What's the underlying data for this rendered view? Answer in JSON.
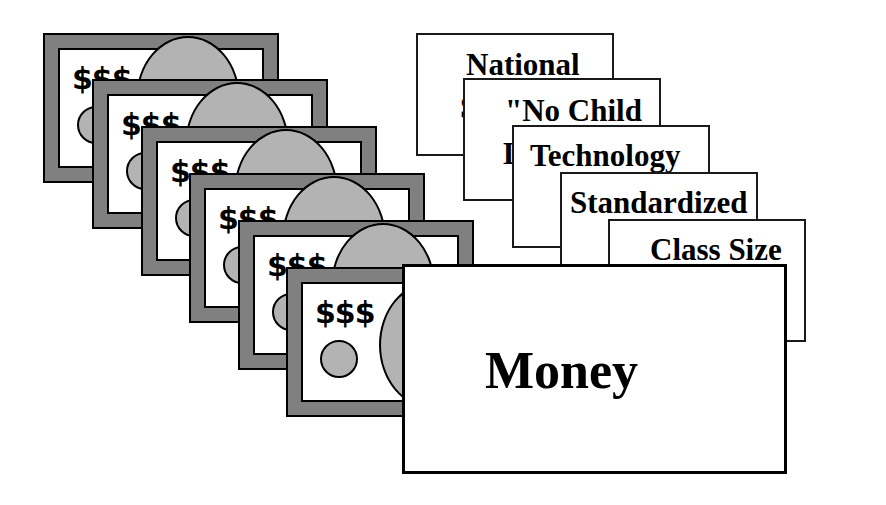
{
  "figure": {
    "type": "layered-stack-diagram",
    "background_color": "#ffffff",
    "line_color": "#000000"
  },
  "money_stack": {
    "name": "money-bills",
    "count": 6,
    "symbol": "$$$",
    "frame_color": "#808080",
    "inner_color": "#ffffff",
    "ellipse_color": "#b3b3b3",
    "border_color": "#000000",
    "bills": [
      {
        "label": "$$$",
        "x": 43,
        "y": 33,
        "w": 236,
        "h": 150
      },
      {
        "label": "$$$",
        "x": 92,
        "y": 79,
        "w": 236,
        "h": 150
      },
      {
        "label": "$$$",
        "x": 141,
        "y": 126,
        "w": 236,
        "h": 150
      },
      {
        "label": "$$$",
        "x": 189,
        "y": 173,
        "w": 236,
        "h": 150
      },
      {
        "label": "$$$",
        "x": 238,
        "y": 220,
        "w": 236,
        "h": 150
      },
      {
        "label": "$$$",
        "x": 286,
        "y": 267,
        "w": 236,
        "h": 150
      }
    ]
  },
  "issue_cards": {
    "name": "issue-cards",
    "count": 6,
    "cards": [
      {
        "label": "National",
        "hidden_line": "S",
        "x": 416,
        "y": 33,
        "w": 198,
        "h": 123
      },
      {
        "label": "\"No Child",
        "hidden_line": "L",
        "x": 463,
        "y": 78,
        "w": 198,
        "h": 123
      },
      {
        "label": "Technology",
        "hidden_line": "",
        "x": 512,
        "y": 125,
        "w": 198,
        "h": 123
      },
      {
        "label": "Standardized",
        "hidden_line": "",
        "x": 560,
        "y": 172,
        "w": 198,
        "h": 123
      },
      {
        "label": "Class Size",
        "hidden_line": "",
        "x": 608,
        "y": 219,
        "w": 198,
        "h": 123
      },
      {
        "label": "Money",
        "hidden_line": "",
        "x": 402,
        "y": 264,
        "w": 385,
        "h": 210
      }
    ]
  }
}
